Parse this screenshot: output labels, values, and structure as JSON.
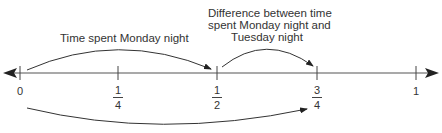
{
  "diagram": {
    "type": "number_line",
    "axis": {
      "min": 0,
      "max": 1,
      "arrows": "both",
      "ticks": [
        {
          "value": 0,
          "label": "0",
          "kind": "whole"
        },
        {
          "value": 0.25,
          "label_num": "1",
          "label_den": "4",
          "kind": "fraction"
        },
        {
          "value": 0.5,
          "label_num": "1",
          "label_den": "2",
          "kind": "fraction"
        },
        {
          "value": 0.75,
          "label_num": "3",
          "label_den": "4",
          "kind": "fraction"
        },
        {
          "value": 1,
          "label": "1",
          "kind": "whole"
        }
      ]
    },
    "jumps": [
      {
        "from": 0,
        "to": 0.5,
        "position": "above",
        "label": "Time spent Monday night"
      },
      {
        "from": 0.5,
        "to": 0.75,
        "position": "above",
        "label_lines": [
          "Difference between time",
          "spent Monday night and",
          "Tuesday night"
        ]
      },
      {
        "from": 0,
        "to": 0.75,
        "position": "below",
        "label": ""
      }
    ],
    "colors": {
      "line": "#2a2a2a",
      "text": "#333333",
      "background": "#ffffff"
    }
  }
}
